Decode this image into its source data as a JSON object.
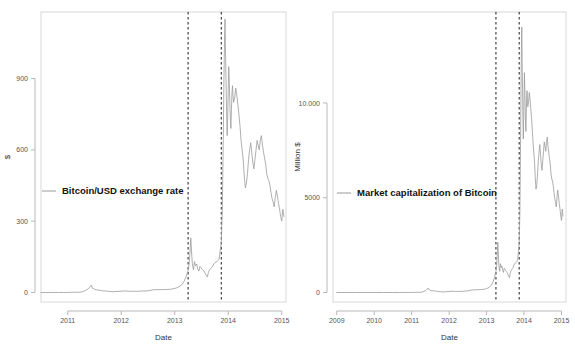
{
  "figure": {
    "background": "#ffffff",
    "line_color": "#9a9a9a",
    "event_line_color": "#1a1a1a",
    "frame_color": "#d8d8d8"
  },
  "chart_data": [
    {
      "type": "line",
      "panel": "left",
      "title": "",
      "xlabel": "Date",
      "ylabel": "$",
      "legend": [
        "Bitcoin/USD exchange rate"
      ],
      "legend_position": "center-left",
      "grid": false,
      "xlim": [
        2010.5,
        2015.08
      ],
      "ylim": [
        -40,
        1180
      ],
      "xticks": [
        2011,
        2012,
        2013,
        2014,
        2015
      ],
      "xticklabels": [
        "2011",
        "2012",
        "2013",
        "2014",
        "2015"
      ],
      "yticks": [
        0,
        300,
        600,
        900
      ],
      "yticklabels": [
        "0",
        "300",
        "600",
        "900"
      ],
      "annotations": [
        {
          "type": "vline",
          "x": 2013.25,
          "style": "dashed"
        },
        {
          "type": "vline",
          "x": 2013.87,
          "style": "dashed"
        }
      ],
      "series": [
        {
          "name": "Bitcoin/USD exchange rate",
          "x": [
            2010.5,
            2010.58,
            2010.67,
            2010.75,
            2010.83,
            2010.92,
            2011.0,
            2011.08,
            2011.17,
            2011.25,
            2011.33,
            2011.38,
            2011.42,
            2011.44,
            2011.46,
            2011.5,
            2011.54,
            2011.58,
            2011.63,
            2011.67,
            2011.75,
            2011.83,
            2011.92,
            2012.0,
            2012.08,
            2012.17,
            2012.25,
            2012.33,
            2012.42,
            2012.5,
            2012.58,
            2012.63,
            2012.67,
            2012.75,
            2012.83,
            2012.92,
            2013.0,
            2013.04,
            2013.08,
            2013.13,
            2013.17,
            2013.21,
            2013.25,
            2013.27,
            2013.29,
            2013.3,
            2013.32,
            2013.33,
            2013.35,
            2013.37,
            2013.39,
            2013.41,
            2013.43,
            2013.45,
            2013.47,
            2013.49,
            2013.51,
            2013.53,
            2013.55,
            2013.57,
            2013.59,
            2013.61,
            2013.63,
            2013.65,
            2013.67,
            2013.69,
            2013.71,
            2013.73,
            2013.75,
            2013.77,
            2013.79,
            2013.81,
            2013.83,
            2013.85,
            2013.87,
            2013.89,
            2013.9,
            2013.91,
            2013.92,
            2013.93,
            2013.94,
            2013.95,
            2013.96,
            2013.97,
            2013.98,
            2013.99,
            2014.0,
            2014.01,
            2014.02,
            2014.03,
            2014.04,
            2014.05,
            2014.06,
            2014.07,
            2014.08,
            2014.09,
            2014.1,
            2014.12,
            2014.14,
            2014.16,
            2014.18,
            2014.2,
            2014.22,
            2014.24,
            2014.26,
            2014.28,
            2014.3,
            2014.32,
            2014.34,
            2014.36,
            2014.38,
            2014.4,
            2014.42,
            2014.44,
            2014.46,
            2014.48,
            2014.5,
            2014.52,
            2014.54,
            2014.56,
            2014.58,
            2014.6,
            2014.62,
            2014.64,
            2014.66,
            2014.68,
            2014.7,
            2014.72,
            2014.74,
            2014.76,
            2014.78,
            2014.8,
            2014.82,
            2014.84,
            2014.86,
            2014.88,
            2014.9,
            2014.92,
            2014.94,
            2014.96,
            2014.98,
            2015.0,
            2015.02,
            2015.04
          ],
          "y": [
            0.06,
            0.06,
            0.07,
            0.08,
            0.2,
            0.25,
            0.3,
            0.9,
            1.0,
            1.5,
            8.0,
            15.0,
            25.0,
            31.0,
            18.0,
            14.0,
            11.0,
            10.0,
            8.0,
            7.0,
            5.5,
            3.0,
            4.5,
            5.5,
            6.5,
            5.0,
            5.1,
            5.2,
            6.5,
            7.0,
            10.5,
            12.0,
            11.5,
            12.0,
            12.5,
            13.5,
            17.0,
            20.0,
            25.0,
            32.0,
            45.0,
            65.0,
            93.0,
            120.0,
            188.0,
            230.0,
            150.0,
            120.0,
            95.0,
            130.0,
            112.0,
            120.0,
            100.0,
            90.0,
            110.0,
            105.0,
            98.0,
            93.0,
            90.0,
            80.0,
            72.0,
            65.0,
            85.0,
            95.0,
            100.0,
            105.0,
            110.0,
            120.0,
            125.0,
            128.0,
            130.0,
            135.0,
            140.0,
            175.0,
            210.0,
            350.0,
            520.0,
            700.0,
            900.0,
            1050.0,
            1150.0,
            1000.0,
            880.0,
            760.0,
            660.0,
            740.0,
            850.0,
            950.0,
            880.0,
            800.0,
            730.0,
            690.0,
            770.0,
            840.0,
            870.0,
            830.0,
            800.0,
            820.0,
            860.0,
            830.0,
            790.0,
            750.0,
            700.0,
            640.0,
            600.0,
            560.0,
            490.0,
            440.0,
            460.0,
            500.0,
            560.0,
            600.0,
            630.0,
            590.0,
            545.0,
            520.0,
            560.0,
            600.0,
            640.0,
            620.0,
            600.0,
            640.0,
            660.0,
            620.0,
            590.0,
            565.0,
            540.0,
            500.0,
            480.0,
            470.0,
            450.0,
            420.0,
            395.0,
            380.0,
            360.0,
            400.0,
            430.0,
            405.0,
            375.0,
            350.0,
            320.0,
            300.0,
            350.0,
            320.0,
            305.0
          ]
        }
      ]
    },
    {
      "type": "line",
      "panel": "right",
      "title": "",
      "xlabel": "Date",
      "ylabel": "Million $",
      "legend": [
        "Market capitalization of Bitcoin"
      ],
      "legend_position": "center-left",
      "grid": false,
      "xlim": [
        2008.9,
        2015.12
      ],
      "ylim": [
        -500,
        14800
      ],
      "xticks": [
        2009,
        2010,
        2011,
        2012,
        2013,
        2014,
        2015
      ],
      "xticklabels": [
        "2009",
        "2010",
        "2011",
        "2012",
        "2013",
        "2014",
        "2015"
      ],
      "yticks": [
        0,
        5000,
        10000
      ],
      "yticklabels": [
        "0",
        "5000",
        "10.000"
      ],
      "annotations": [
        {
          "type": "vline",
          "x": 2013.25,
          "style": "dashed"
        },
        {
          "type": "vline",
          "x": 2013.87,
          "style": "dashed"
        }
      ],
      "series": [
        {
          "name": "Market capitalization of Bitcoin",
          "x": [
            2009.0,
            2009.25,
            2009.5,
            2009.75,
            2010.0,
            2010.25,
            2010.5,
            2010.67,
            2010.83,
            2011.0,
            2011.08,
            2011.17,
            2011.25,
            2011.33,
            2011.38,
            2011.42,
            2011.44,
            2011.46,
            2011.5,
            2011.54,
            2011.58,
            2011.63,
            2011.67,
            2011.75,
            2011.83,
            2011.92,
            2012.0,
            2012.08,
            2012.17,
            2012.25,
            2012.33,
            2012.42,
            2012.5,
            2012.58,
            2012.63,
            2012.67,
            2012.75,
            2012.83,
            2012.92,
            2013.0,
            2013.04,
            2013.08,
            2013.13,
            2013.17,
            2013.21,
            2013.25,
            2013.27,
            2013.29,
            2013.3,
            2013.32,
            2013.33,
            2013.35,
            2013.37,
            2013.39,
            2013.41,
            2013.43,
            2013.45,
            2013.47,
            2013.49,
            2013.51,
            2013.53,
            2013.55,
            2013.57,
            2013.59,
            2013.61,
            2013.63,
            2013.65,
            2013.67,
            2013.69,
            2013.71,
            2013.73,
            2013.75,
            2013.77,
            2013.79,
            2013.81,
            2013.83,
            2013.85,
            2013.87,
            2013.89,
            2013.9,
            2013.91,
            2013.92,
            2013.93,
            2013.94,
            2013.95,
            2013.96,
            2013.97,
            2013.98,
            2013.99,
            2014.0,
            2014.01,
            2014.02,
            2014.03,
            2014.04,
            2014.05,
            2014.06,
            2014.07,
            2014.08,
            2014.09,
            2014.1,
            2014.12,
            2014.14,
            2014.16,
            2014.18,
            2014.2,
            2014.22,
            2014.24,
            2014.26,
            2014.28,
            2014.3,
            2014.32,
            2014.34,
            2014.36,
            2014.38,
            2014.4,
            2014.42,
            2014.44,
            2014.46,
            2014.48,
            2014.5,
            2014.52,
            2014.54,
            2014.56,
            2014.58,
            2014.6,
            2014.62,
            2014.64,
            2014.66,
            2014.68,
            2014.7,
            2014.72,
            2014.74,
            2014.76,
            2014.78,
            2014.8,
            2014.82,
            2014.84,
            2014.86,
            2014.88,
            2014.9,
            2014.92,
            2014.94,
            2014.96,
            2014.98,
            2015.0,
            2015.02,
            2015.04
          ],
          "y": [
            0,
            0,
            0,
            0,
            0,
            1,
            2,
            3,
            4,
            5,
            8,
            10,
            14,
            60,
            110,
            190,
            240,
            150,
            120,
            100,
            90,
            80,
            65,
            45,
            30,
            45,
            55,
            68,
            55,
            58,
            62,
            75,
            85,
            125,
            140,
            138,
            145,
            152,
            168,
            200,
            240,
            300,
            390,
            540,
            790,
            1120,
            1420,
            2200,
            2650,
            1750,
            1400,
            1120,
            1520,
            1320,
            1400,
            1180,
            1060,
            1280,
            1230,
            1150,
            1100,
            1060,
            950,
            860,
            780,
            1020,
            1140,
            1200,
            1270,
            1330,
            1450,
            1520,
            1560,
            1590,
            1650,
            1720,
            2150,
            2600,
            4300,
            6400,
            8600,
            11000,
            12800,
            14000,
            12200,
            10700,
            9300,
            8100,
            9100,
            10400,
            11600,
            10800,
            9800,
            9000,
            8500,
            9450,
            10300,
            10650,
            10200,
            9800,
            10050,
            10550,
            10200,
            9700,
            9200,
            8600,
            7900,
            7400,
            6900,
            6050,
            5450,
            5700,
            6200,
            6900,
            7400,
            7800,
            7300,
            6750,
            6450,
            6950,
            7450,
            7950,
            7700,
            7450,
            7950,
            8200,
            7700,
            7350,
            7050,
            6750,
            6250,
            6000,
            5880,
            5630,
            5270,
            4950,
            4760,
            4520,
            5020,
            5400,
            5080,
            4700,
            4400,
            4030,
            3800,
            4400,
            4030,
            3850
          ]
        }
      ]
    }
  ]
}
